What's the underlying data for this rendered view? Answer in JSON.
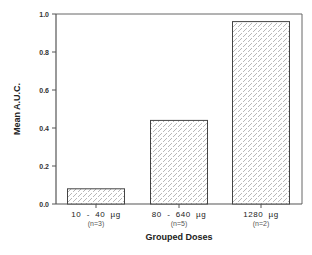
{
  "chart_data": {
    "type": "bar",
    "title": "",
    "xlabel": "Grouped Doses",
    "ylabel": "Mean  A.U.C.",
    "ylim": [
      0,
      1.0
    ],
    "yticks": [
      "0.0",
      "0.2",
      "0.4",
      "0.6",
      "0.8",
      "1.0"
    ],
    "grid": false,
    "legend": null,
    "categories": [
      "10  -  40  µg",
      "80  -  640  µg",
      "1280  µg"
    ],
    "category_notes": [
      "(n=3)",
      "(n=5)",
      "(n=2)"
    ],
    "values": [
      0.08,
      0.44,
      0.96
    ],
    "bar_fill": "crosshatch-dots",
    "colors": {
      "axis": "#555555",
      "bar_border": "#444444",
      "pattern": "#888888"
    }
  }
}
